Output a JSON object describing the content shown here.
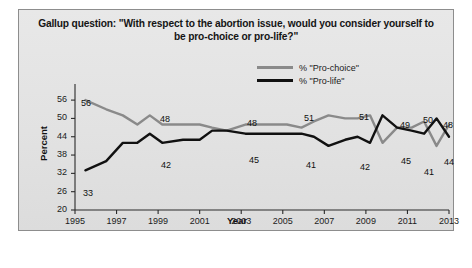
{
  "chart_data": {
    "type": "line",
    "title": "Gallup question: \"With respect to the abortion issue, would you consider yourself to be pro-choice or pro-life?\"",
    "title_line1": "Gallup question: \"With respect to the abortion issue, would you consider yourself to",
    "title_line2": "be pro-choice or pro-life?\"",
    "xlabel": "Year",
    "ylabel": "Percent",
    "xlim": [
      1995,
      2013
    ],
    "ylim": [
      20,
      58
    ],
    "yticks": [
      20,
      26,
      32,
      38,
      44,
      50,
      56
    ],
    "xticks": [
      1995,
      1997,
      1999,
      2001,
      2003,
      2005,
      2007,
      2009,
      2011,
      2013
    ],
    "grid": false,
    "legend_position": "top-right",
    "series": [
      {
        "name": "% \"Pro-choice\"",
        "color": "#8a8a8a",
        "x": [
          1995.5,
          1996.5,
          1997.3,
          1998.0,
          1998.6,
          1999.2,
          2000.2,
          2001.0,
          2001.6,
          2002.3,
          2003.2,
          2004.2,
          2005.2,
          2005.9,
          2006.5,
          2007.2,
          2008.0,
          2008.6,
          2009.2,
          2009.8,
          2010.5,
          2011.2,
          2011.8,
          2012.4,
          2013.0
        ],
        "values": [
          56,
          53,
          51,
          48,
          51,
          48,
          48,
          48,
          47,
          46,
          48,
          48,
          48,
          47,
          49,
          51,
          50,
          50,
          51,
          42,
          47,
          47,
          49,
          41,
          48
        ]
      },
      {
        "name": "% \"Pro-life\"",
        "color": "#111111",
        "x": [
          1995.5,
          1996.5,
          1997.3,
          1998.0,
          1998.6,
          1999.2,
          2000.2,
          2001.0,
          2001.6,
          2002.3,
          2003.2,
          2004.2,
          2005.2,
          2005.9,
          2006.5,
          2007.2,
          2008.0,
          2008.6,
          2009.2,
          2009.8,
          2010.5,
          2011.2,
          2011.8,
          2012.4,
          2013.0
        ],
        "values": [
          33,
          36,
          42,
          42,
          45,
          42,
          43,
          43,
          46,
          46,
          45,
          45,
          45,
          45,
          44,
          41,
          43,
          44,
          42,
          51,
          47,
          46,
          45,
          50,
          44
        ]
      }
    ],
    "point_labels": [
      {
        "text": "56",
        "x": 62,
        "y": 88,
        "series": "% \"Pro-choice\""
      },
      {
        "text": "33",
        "x": 64,
        "y": 178,
        "series": "% \"Pro-life\""
      },
      {
        "text": "48",
        "x": 141,
        "y": 104,
        "series": "% \"Pro-choice\""
      },
      {
        "text": "42",
        "x": 142,
        "y": 150,
        "series": "% \"Pro-life\""
      },
      {
        "text": "48",
        "x": 228,
        "y": 108,
        "series": "% \"Pro-choice\""
      },
      {
        "text": "45",
        "x": 230,
        "y": 145,
        "series": "% \"Pro-life\""
      },
      {
        "text": "51",
        "x": 285,
        "y": 103,
        "series": "% \"Pro-choice\""
      },
      {
        "text": "41",
        "x": 287,
        "y": 150,
        "series": "% \"Pro-life\""
      },
      {
        "text": "51",
        "x": 340,
        "y": 102,
        "series": "% \"Pro-life\""
      },
      {
        "text": "42",
        "x": 341,
        "y": 152,
        "series": "% \"Pro-choice\""
      },
      {
        "text": "49",
        "x": 381,
        "y": 110,
        "series": "% \"Pro-life\""
      },
      {
        "text": "45",
        "x": 382,
        "y": 146,
        "series": "% \"Pro-choice\""
      },
      {
        "text": "50",
        "x": 404,
        "y": 105,
        "series": "% \"Pro-life\""
      },
      {
        "text": "41",
        "x": 405,
        "y": 157,
        "series": "% \"Pro-choice\""
      },
      {
        "text": "48",
        "x": 424,
        "y": 110,
        "series": "% \"Pro-life\""
      },
      {
        "text": "44",
        "x": 425,
        "y": 147,
        "series": "% \"Pro-choice\""
      }
    ]
  },
  "legend": [
    {
      "label": "% \"Pro-choice\"",
      "color": "#8a8a8a"
    },
    {
      "label": "% \"Pro-life\"",
      "color": "#111111"
    }
  ]
}
